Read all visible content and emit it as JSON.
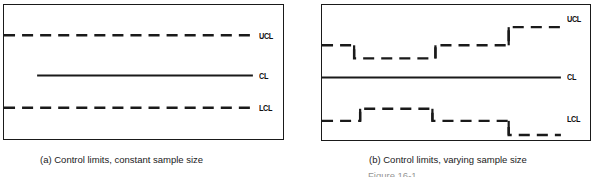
{
  "figure": {
    "background_color": "#ffffff",
    "line_color": "#1a1a1a",
    "panels": [
      {
        "id": "a",
        "caption": "(a) Control limits, constant sample size",
        "labels": {
          "ucl": "UCL",
          "cl": "CL",
          "lcl": "LCL"
        },
        "label_positions": {
          "ucl_top": 27,
          "cl_top": 67,
          "lcl_top": 99
        },
        "box": {
          "x": 3,
          "y": 4,
          "width": 281,
          "height": 136
        },
        "series": {
          "ucl": {
            "style": "dashed",
            "y": 30,
            "x_start": 0,
            "x_end": 248
          },
          "cl": {
            "style": "solid",
            "y": 70,
            "x_start": 33,
            "x_end": 248
          },
          "lcl": {
            "style": "dashed",
            "y": 102,
            "x_start": 0,
            "x_end": 248
          }
        }
      },
      {
        "id": "b",
        "caption": "(b) Control limits, varying sample size",
        "labels": {
          "ucl": "UCL",
          "cl": "CL",
          "lcl": "LCL"
        },
        "label_positions": {
          "ucl_top": 10,
          "cl_top": 68,
          "lcl_top": 110
        },
        "box": {
          "x": 321,
          "y": 4,
          "width": 270,
          "height": 137
        },
        "series": {
          "ucl": {
            "style": "dashed-step",
            "steps": [
              {
                "x_start": 0,
                "x_end": 32,
                "y": 40
              },
              {
                "x_start": 32,
                "x_end": 39,
                "y": 40
              },
              {
                "x_start": 39,
                "x_end": 113,
                "y": 53
              },
              {
                "x_start": 113,
                "x_end": 186,
                "y": 40
              },
              {
                "x_start": 186,
                "x_end": 238,
                "y": 22
              }
            ]
          },
          "cl": {
            "style": "solid",
            "y": 72,
            "x_start": 0,
            "x_end": 238
          },
          "lcl": {
            "style": "dashed-step",
            "steps": [
              {
                "x_start": 0,
                "x_end": 38,
                "y": 115
              },
              {
                "x_start": 38,
                "x_end": 110,
                "y": 103
              },
              {
                "x_start": 110,
                "x_end": 186,
                "y": 115
              },
              {
                "x_start": 186,
                "x_end": 238,
                "y": 129
              }
            ]
          }
        }
      }
    ],
    "tail_text": "Figure 16-1"
  }
}
